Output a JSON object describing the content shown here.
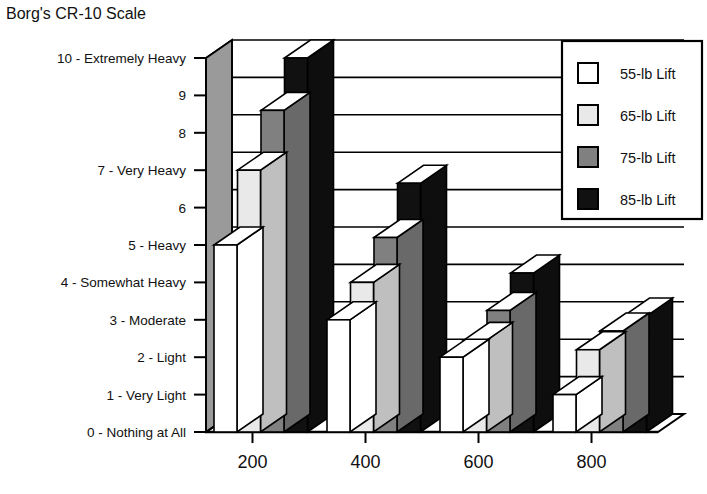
{
  "chart_data": {
    "type": "bar",
    "title": "Borg's CR-10 Scale",
    "xlabel": "",
    "ylabel": "",
    "ylim": [
      0,
      10
    ],
    "grid": true,
    "legend_position": "top-right",
    "three_d": true,
    "categories": [
      "200",
      "400",
      "600",
      "800"
    ],
    "series": [
      {
        "name": "55-lb Lift",
        "color": "#ffffff",
        "values": [
          5,
          3,
          2,
          1
        ]
      },
      {
        "name": "65-lb Lift",
        "color": "#e9e9e9",
        "values": [
          7,
          4,
          2.45,
          2.2
        ]
      },
      {
        "name": "75-lb Lift",
        "color": "#808080",
        "values": [
          8.6,
          5.2,
          3.25,
          2.7
        ]
      },
      {
        "name": "85-lb Lift",
        "color": "#111111",
        "values": [
          10,
          6.65,
          4.25,
          3.1
        ]
      }
    ],
    "y_tick_labels": [
      "0 - Nothing at All",
      "1 - Very Light",
      "2 - Light",
      "3 - Moderate",
      "4 - Somewhat Heavy",
      "5 - Heavy",
      "6",
      "7 - Very Heavy",
      "8",
      "9",
      "10 - Extremely Heavy"
    ],
    "x_tick_labels": [
      "200",
      "400",
      "600",
      "800"
    ]
  },
  "legend": {
    "items": [
      {
        "label": "55-lb Lift",
        "swatch": "#ffffff"
      },
      {
        "label": "65-lb Lift",
        "swatch": "#e9e9e9"
      },
      {
        "label": "75-lb Lift",
        "swatch": "#808080"
      },
      {
        "label": "85-lb Lift",
        "swatch": "#111111"
      }
    ]
  },
  "colors": {
    "background": "#ffffff",
    "stroke": "#000000",
    "text": "#111111",
    "side_face_tint": "#b4b4b4"
  }
}
